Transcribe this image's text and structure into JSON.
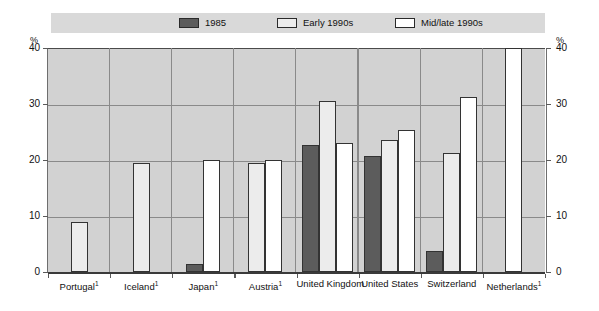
{
  "chart_data": {
    "type": "bar",
    "title": "",
    "xlabel": "",
    "ylabel": "%",
    "ylim": [
      0,
      40
    ],
    "yticks": [
      0,
      10,
      20,
      30,
      40
    ],
    "grid": true,
    "legend_position": "top",
    "categories": [
      "Portugal¹",
      "Iceland¹",
      "Japan¹",
      "Austria¹",
      "United Kingdom",
      "United States",
      "Switzerland",
      "Netherlands¹"
    ],
    "series": [
      {
        "name": "1985",
        "color": "#5c5c5c",
        "values": [
          null,
          null,
          1.5,
          null,
          22.7,
          20.7,
          3.8,
          null
        ]
      },
      {
        "name": "Early 1990s",
        "color": "#ececec",
        "values": [
          9.0,
          19.5,
          null,
          19.5,
          30.5,
          23.5,
          21.3,
          null
        ]
      },
      {
        "name": "Mid/late 1990s",
        "color": "#ffffff",
        "values": [
          null,
          null,
          20.0,
          20.0,
          23.0,
          25.3,
          31.3,
          40.0
        ]
      }
    ]
  },
  "axis": {
    "unit_left": "%",
    "unit_right": "%",
    "ticks_left": [
      "40",
      "30",
      "20",
      "10",
      "0"
    ],
    "ticks_right": [
      "40",
      "30",
      "20",
      "10",
      "0"
    ]
  },
  "legend": {
    "items": [
      {
        "label": "1985",
        "swatch_color": "#5c5c5c"
      },
      {
        "label": "Early 1990s",
        "swatch_color": "#ececec"
      },
      {
        "label": "Mid/late 1990s",
        "swatch_color": "#ffffff"
      }
    ]
  },
  "categories_display": [
    {
      "name": "Portugal",
      "note": "1"
    },
    {
      "name": "Iceland",
      "note": "1"
    },
    {
      "name": "Japan",
      "note": "1"
    },
    {
      "name": "Austria",
      "note": "1"
    },
    {
      "name": "United Kingdom",
      "note": ""
    },
    {
      "name": "United States",
      "note": ""
    },
    {
      "name": "Switzerland",
      "note": ""
    },
    {
      "name": "Netherlands",
      "note": "1"
    }
  ],
  "colors": {
    "plot_background": "#d2d2d2",
    "legend_background": "#d9d9d9",
    "gridline": "#8a8a8a",
    "axis": "#3a3a3a",
    "bar_outline": "#333333"
  }
}
